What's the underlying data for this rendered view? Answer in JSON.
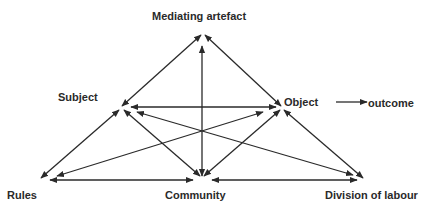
{
  "diagram": {
    "nodes": {
      "mediating_artefact": "Mediating artefact",
      "subject": "Subject",
      "object": "Object",
      "outcome": "outcome",
      "rules": "Rules",
      "community": "Community",
      "division_of_labour": "Division of labour"
    },
    "edges": [
      {
        "from": "Subject",
        "to": "Mediating artefact",
        "arrows": "both"
      },
      {
        "from": "Mediating artefact",
        "to": "Object",
        "arrows": "both"
      },
      {
        "from": "Mediating artefact",
        "to": "Community",
        "arrows": "both"
      },
      {
        "from": "Subject",
        "to": "Object",
        "arrows": "both"
      },
      {
        "from": "Subject",
        "to": "Rules",
        "arrows": "both"
      },
      {
        "from": "Subject",
        "to": "Community",
        "arrows": "both"
      },
      {
        "from": "Subject",
        "to": "Division of labour",
        "arrows": "both"
      },
      {
        "from": "Object",
        "to": "Rules",
        "arrows": "both"
      },
      {
        "from": "Object",
        "to": "Community",
        "arrows": "both"
      },
      {
        "from": "Object",
        "to": "Division of labour",
        "arrows": "both"
      },
      {
        "from": "Rules",
        "to": "Community",
        "arrows": "both"
      },
      {
        "from": "Community",
        "to": "Division of labour",
        "arrows": "both"
      },
      {
        "from": "Object",
        "to": "outcome",
        "arrows": "end"
      }
    ],
    "colors": {
      "line": "#2a2a2a",
      "text": "#2a2a2a",
      "background": "#ffffff"
    }
  }
}
